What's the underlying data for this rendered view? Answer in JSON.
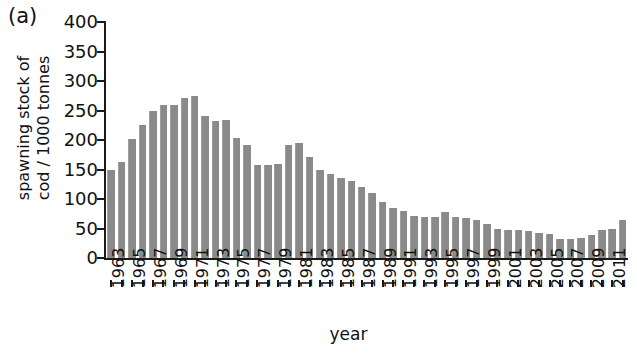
{
  "figure": {
    "panel_label": "(a)",
    "bar_color": "#8a8a8a",
    "axis_color": "#1a1a1a",
    "background": "#ffffff"
  },
  "chart_data": {
    "type": "bar",
    "title": "(a)",
    "xlabel": "year",
    "ylabel_line1": "spawning stock of",
    "ylabel_line2": "cod / 1000 tonnes",
    "ylabel": "spawning stock of cod / 1000 tonnes",
    "ylim": [
      0,
      400
    ],
    "ytick_values": [
      0,
      50,
      100,
      150,
      200,
      250,
      300,
      350,
      400
    ],
    "ytick_labels": [
      "0",
      "50",
      "100",
      "150",
      "200",
      "250",
      "300",
      "350",
      "400"
    ],
    "grid": false,
    "legend": null,
    "xtick_labels": [
      "1963",
      "1965",
      "1967",
      "1969",
      "1971",
      "1973",
      "1975",
      "1977",
      "1979",
      "1981",
      "1983",
      "1985",
      "1987",
      "1989",
      "1991",
      "1993",
      "1995",
      "1997",
      "1999",
      "2001",
      "2003",
      "2005",
      "2007",
      "2009",
      "2011"
    ],
    "categories": [
      "1963",
      "1964",
      "1965",
      "1966",
      "1967",
      "1968",
      "1969",
      "1970",
      "1971",
      "1972",
      "1973",
      "1974",
      "1975",
      "1976",
      "1977",
      "1978",
      "1979",
      "1980",
      "1981",
      "1982",
      "1983",
      "1984",
      "1985",
      "1986",
      "1987",
      "1988",
      "1989",
      "1990",
      "1991",
      "1992",
      "1993",
      "1994",
      "1995",
      "1996",
      "1997",
      "1998",
      "1999",
      "2000",
      "2001",
      "2002",
      "2003",
      "2004",
      "2005",
      "2006",
      "2007",
      "2008",
      "2009",
      "2010",
      "2011",
      "2012"
    ],
    "values": [
      150,
      163,
      202,
      226,
      249,
      259,
      259,
      272,
      274,
      240,
      232,
      234,
      204,
      192,
      158,
      157,
      160,
      192,
      195,
      172,
      149,
      142,
      135,
      131,
      120,
      110,
      95,
      85,
      80,
      72,
      70,
      70,
      78,
      70,
      68,
      64,
      58,
      49,
      47,
      47,
      45,
      43,
      40,
      33,
      33,
      34,
      39,
      48,
      50,
      65
    ]
  }
}
